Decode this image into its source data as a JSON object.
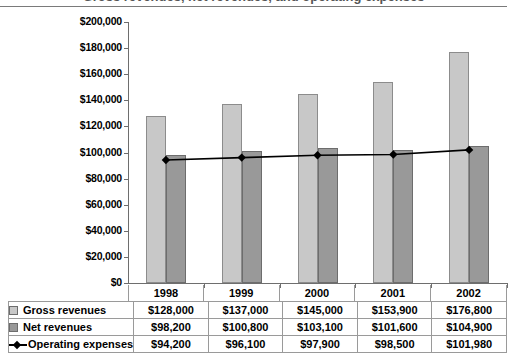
{
  "title": {
    "text": "Gross revenues, net revenues, and operating expenses",
    "clipped": true
  },
  "chart_data": {
    "type": "bar",
    "title": "Gross revenues, net revenues, and operating expenses",
    "xlabel": "",
    "ylabel": "",
    "ylim": [
      0,
      200000
    ],
    "ytick_step": 20000,
    "grid": false,
    "legend_position": "table-left-column",
    "categories": [
      "1998",
      "1999",
      "2000",
      "2001",
      "2002"
    ],
    "ytick_labels": [
      "$200,000",
      "$180,000",
      "$160,000",
      "$140,000",
      "$120,000",
      "$100,000",
      "$80,000",
      "$60,000",
      "$40,000",
      "$20,000",
      "$0"
    ],
    "ytick_values": [
      200000,
      180000,
      160000,
      140000,
      120000,
      100000,
      80000,
      60000,
      40000,
      20000,
      0
    ],
    "series": [
      {
        "name": "Gross revenues",
        "render": "bar",
        "color": "#c8c8c8",
        "values": [
          128000,
          137000,
          145000,
          153900,
          176800
        ],
        "labels": [
          "$128,000",
          "$137,000",
          "$145,000",
          "$153,900",
          "$176,800"
        ]
      },
      {
        "name": "Net revenues",
        "render": "bar",
        "color": "#999999",
        "values": [
          98200,
          100800,
          103100,
          101600,
          104900
        ],
        "labels": [
          "$98,200",
          "$100,800",
          "$103,100",
          "$101,600",
          "$104,900"
        ]
      },
      {
        "name": "Operating expenses",
        "render": "line",
        "color": "#000000",
        "marker": "diamond",
        "values": [
          94200,
          96100,
          97900,
          98500,
          101980
        ],
        "labels": [
          "$94,200",
          "$96,100",
          "$97,900",
          "$98,500",
          "$101,980"
        ]
      }
    ]
  },
  "table": {
    "columns": [
      "",
      "1998",
      "1999",
      "2000",
      "2001",
      "2002"
    ],
    "rows": [
      {
        "label": "Gross revenues",
        "swatch": "light-gray-square",
        "values": [
          "$128,000",
          "$137,000",
          "$145,000",
          "$153,900",
          "$176,800"
        ]
      },
      {
        "label": "Net revenues",
        "swatch": "dark-gray-square",
        "values": [
          "$98,200",
          "$100,800",
          "$103,100",
          "$101,600",
          "$104,900"
        ]
      },
      {
        "label": "Operating expenses",
        "swatch": "black-diamond-line",
        "values": [
          "$94,200",
          "$96,100",
          "$97,900",
          "$98,500",
          "$101,980"
        ]
      }
    ]
  },
  "colors": {
    "gross": "#c8c8c8",
    "net": "#999999",
    "line": "#000000",
    "axis": "#6e6e6e",
    "grid_border": "#9a9a9a"
  }
}
